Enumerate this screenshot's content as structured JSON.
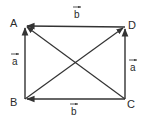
{
  "diagram": {
    "vertices": {
      "A": {
        "label": "A",
        "x": 25,
        "y": 26
      },
      "B": {
        "label": "B",
        "x": 25,
        "y": 99
      },
      "C": {
        "label": "C",
        "x": 125,
        "y": 99
      },
      "D": {
        "label": "D",
        "x": 125,
        "y": 27
      }
    },
    "vector_labels": {
      "top": "b",
      "bottom": "b",
      "left": "a",
      "right": "a"
    },
    "edges": [
      {
        "from": "D",
        "to": "A",
        "label": "b"
      },
      {
        "from": "C",
        "to": "B",
        "label": "b"
      },
      {
        "from": "B",
        "to": "A",
        "label": "a"
      },
      {
        "from": "C",
        "to": "D",
        "label": "a"
      },
      {
        "from": "B",
        "to": "D",
        "label": ""
      },
      {
        "from": "C",
        "to": "A",
        "label": ""
      }
    ],
    "colors": {
      "stroke": "#333333",
      "text": "#2a2a2a",
      "background": "#ffffff"
    }
  }
}
